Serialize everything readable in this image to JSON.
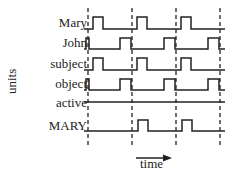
{
  "diagram": {
    "y_axis_label": "units",
    "x_axis_label": "time",
    "rows": [
      {
        "label": "Mary",
        "pulses": [
          [
            0.2,
            0.9
          ],
          [
            1.2,
            1.9
          ],
          [
            2.2,
            2.9
          ]
        ]
      },
      {
        "label": "John",
        "pulses": [
          [
            0.8,
            1.0
          ],
          [
            1.8,
            2.0
          ],
          [
            2.8,
            3.0
          ]
        ],
        "pulses_note": "wide pulses ending just after each dashed line"
      },
      {
        "label": "subject",
        "pulses": [
          [
            0.2,
            0.9
          ],
          [
            1.2,
            1.9
          ],
          [
            2.2,
            2.9
          ]
        ]
      },
      {
        "label": "object",
        "pulses": [
          [
            0.8,
            1.0
          ],
          [
            1.8,
            2.0
          ],
          [
            2.8,
            3.0
          ]
        ]
      },
      {
        "label": "active",
        "pulses": []
      },
      {
        "label": "MARY",
        "pulses": [
          [
            1.1,
            1.35
          ],
          [
            2.1,
            2.35
          ]
        ]
      }
    ],
    "dashed_line_count": 4
  }
}
